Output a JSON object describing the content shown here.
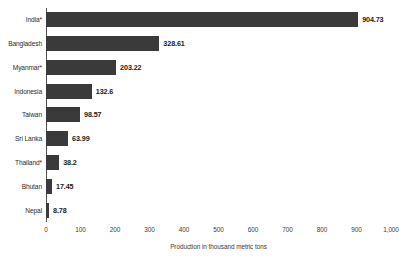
{
  "chart_data": {
    "type": "bar",
    "orientation": "horizontal",
    "title": "",
    "xlabel": "Production in thousand metric tons",
    "ylabel": "",
    "xlim": [
      0,
      1000
    ],
    "xticks": [
      "0",
      "100",
      "200",
      "300",
      "400",
      "500",
      "600",
      "700",
      "800",
      "900",
      "1,000"
    ],
    "xtick_values": [
      0,
      100,
      200,
      300,
      400,
      500,
      600,
      700,
      800,
      900,
      1000
    ],
    "grid": false,
    "legend": null,
    "bar_color": "#3a3a3a",
    "categories": [
      "India*",
      "Bangladesh",
      "Myanmar*",
      "Indonesia",
      "Taiwan",
      "Sri Lanka",
      "Thailand*",
      "Bhutan",
      "Nepal"
    ],
    "values": [
      904.73,
      328.61,
      203.22,
      132.6,
      98.57,
      63.99,
      38.2,
      17.45,
      8.78
    ],
    "value_labels": [
      "904.73",
      "328.61",
      "203.22",
      "132.6",
      "98.57",
      "63.99",
      "38.2",
      "17.45",
      "8.78"
    ]
  }
}
